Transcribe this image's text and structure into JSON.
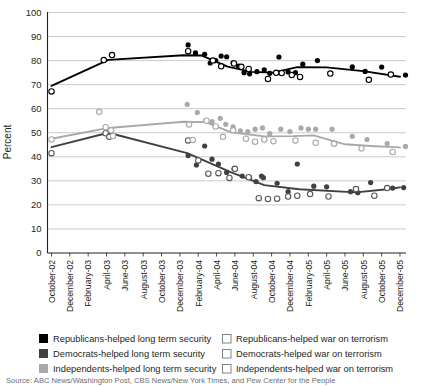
{
  "chart_data": {
    "type": "line",
    "title": "",
    "xlabel": "",
    "ylabel": "Percent",
    "ylim": [
      0,
      100
    ],
    "yticks": [
      0,
      10,
      20,
      30,
      40,
      50,
      60,
      70,
      80,
      90,
      100
    ],
    "grid": true,
    "legend_position": "bottom",
    "categories": [
      "October-02",
      "December-02",
      "February-03",
      "April-03",
      "June-03",
      "August-03",
      "October-03",
      "December-03",
      "February-04",
      "April-04",
      "June-04",
      "August-04",
      "October-04",
      "December-04",
      "February-05",
      "April-05",
      "June-05",
      "August-05",
      "October-05",
      "December-05"
    ],
    "series": [
      {
        "name": "Republicans-helped long term security",
        "marker": "filled-circle",
        "color": "#000000",
        "trend_color": "#000000",
        "trend": [
          {
            "x": 0,
            "y": 69.5
          },
          {
            "x": 3.1,
            "y": 80.3
          },
          {
            "x": 7.2,
            "y": 82.2
          },
          {
            "x": 8.2,
            "y": 82.1
          },
          {
            "x": 9.6,
            "y": 77.5
          },
          {
            "x": 10.9,
            "y": 75.3
          },
          {
            "x": 12.1,
            "y": 75.0
          },
          {
            "x": 13.4,
            "y": 77.3
          },
          {
            "x": 15.0,
            "y": 77.2
          },
          {
            "x": 17.0,
            "y": 75.6
          },
          {
            "x": 19.0,
            "y": 73.3
          }
        ],
        "points": [
          {
            "x": 7.45,
            "y": 86.5
          },
          {
            "x": 7.85,
            "y": 83.2
          },
          {
            "x": 8.35,
            "y": 82.6
          },
          {
            "x": 8.65,
            "y": 79.0
          },
          {
            "x": 8.95,
            "y": 80.0
          },
          {
            "x": 9.25,
            "y": 81.9
          },
          {
            "x": 9.55,
            "y": 81.6
          },
          {
            "x": 9.9,
            "y": 79.1
          },
          {
            "x": 10.2,
            "y": 77.7
          },
          {
            "x": 10.5,
            "y": 75.0
          },
          {
            "x": 10.8,
            "y": 74.5
          },
          {
            "x": 11.2,
            "y": 75.4
          },
          {
            "x": 11.6,
            "y": 76.2
          },
          {
            "x": 11.9,
            "y": 74.7
          },
          {
            "x": 12.4,
            "y": 81.5
          },
          {
            "x": 12.9,
            "y": 75.3
          },
          {
            "x": 13.3,
            "y": 75.0
          },
          {
            "x": 13.7,
            "y": 78.5
          },
          {
            "x": 14.5,
            "y": 80.0
          },
          {
            "x": 16.4,
            "y": 77.4
          },
          {
            "x": 17.1,
            "y": 75.5
          },
          {
            "x": 18.0,
            "y": 77.3
          },
          {
            "x": 19.3,
            "y": 74.0
          }
        ]
      },
      {
        "name": "Democrats-helped long term security",
        "marker": "filled-circle",
        "color": "#404040",
        "trend_color": "#404040",
        "trend": [
          {
            "x": 0,
            "y": 44.0
          },
          {
            "x": 3.1,
            "y": 50.0
          },
          {
            "x": 7.4,
            "y": 41.5
          },
          {
            "x": 9.8,
            "y": 33.5
          },
          {
            "x": 11.6,
            "y": 28.2
          },
          {
            "x": 13.5,
            "y": 26.5
          },
          {
            "x": 16.6,
            "y": 25.2
          },
          {
            "x": 18.3,
            "y": 26.5
          },
          {
            "x": 19.0,
            "y": 27.3
          }
        ],
        "points": [
          {
            "x": 7.45,
            "y": 40.5
          },
          {
            "x": 7.9,
            "y": 36.6
          },
          {
            "x": 8.35,
            "y": 44.5
          },
          {
            "x": 8.75,
            "y": 39.0
          },
          {
            "x": 9.1,
            "y": 37.0
          },
          {
            "x": 9.55,
            "y": 33.5
          },
          {
            "x": 9.95,
            "y": 35.0
          },
          {
            "x": 10.4,
            "y": 32.0
          },
          {
            "x": 10.8,
            "y": 31.5
          },
          {
            "x": 11.15,
            "y": 29.7
          },
          {
            "x": 11.45,
            "y": 32.0
          },
          {
            "x": 11.55,
            "y": 31.3
          },
          {
            "x": 12.3,
            "y": 29.0
          },
          {
            "x": 12.9,
            "y": 25.5
          },
          {
            "x": 13.4,
            "y": 37.0
          },
          {
            "x": 14.3,
            "y": 27.8
          },
          {
            "x": 15.0,
            "y": 27.5
          },
          {
            "x": 16.3,
            "y": 25.5
          },
          {
            "x": 16.7,
            "y": 25.1
          },
          {
            "x": 17.4,
            "y": 29.3
          },
          {
            "x": 18.6,
            "y": 27.0
          },
          {
            "x": 19.2,
            "y": 27.2
          }
        ]
      },
      {
        "name": "Independents-helped long term security",
        "marker": "filled-circle",
        "color": "#a7a9ac",
        "trend_color": "#a7a9ac",
        "trend": [
          {
            "x": 0,
            "y": 47.5
          },
          {
            "x": 3.1,
            "y": 52.0
          },
          {
            "x": 7.2,
            "y": 54.6
          },
          {
            "x": 8.4,
            "y": 54.4
          },
          {
            "x": 9.8,
            "y": 50.2
          },
          {
            "x": 11.6,
            "y": 48.5
          },
          {
            "x": 13.2,
            "y": 48.6
          },
          {
            "x": 14.3,
            "y": 48.9
          },
          {
            "x": 16.0,
            "y": 45.2
          },
          {
            "x": 17.4,
            "y": 44.5
          },
          {
            "x": 19.0,
            "y": 43.9
          }
        ],
        "points": [
          {
            "x": 7.4,
            "y": 61.8
          },
          {
            "x": 7.95,
            "y": 58.4
          },
          {
            "x": 8.4,
            "y": 55.2
          },
          {
            "x": 8.75,
            "y": 54.6
          },
          {
            "x": 9.2,
            "y": 56.0
          },
          {
            "x": 9.5,
            "y": 53.5
          },
          {
            "x": 9.9,
            "y": 52.5
          },
          {
            "x": 10.3,
            "y": 50.8
          },
          {
            "x": 10.7,
            "y": 50.5
          },
          {
            "x": 11.1,
            "y": 51.5
          },
          {
            "x": 11.5,
            "y": 52.0
          },
          {
            "x": 11.9,
            "y": 49.6
          },
          {
            "x": 12.5,
            "y": 51.5
          },
          {
            "x": 13.0,
            "y": 50.5
          },
          {
            "x": 13.6,
            "y": 52.0
          },
          {
            "x": 14.0,
            "y": 51.5
          },
          {
            "x": 14.4,
            "y": 51.5
          },
          {
            "x": 15.3,
            "y": 51.5
          },
          {
            "x": 16.4,
            "y": 48.5
          },
          {
            "x": 17.2,
            "y": 47.2
          },
          {
            "x": 18.3,
            "y": 45.5
          },
          {
            "x": 19.3,
            "y": 44.3
          }
        ]
      },
      {
        "name": "Republicans-helped war on terrorism",
        "marker": "open-circle",
        "color": "#000000",
        "points": [
          {
            "x": 0,
            "y": 67.2
          },
          {
            "x": 2.85,
            "y": 80.2
          },
          {
            "x": 3.3,
            "y": 82.3
          },
          {
            "x": 7.45,
            "y": 83.9
          },
          {
            "x": 8.8,
            "y": 80.0
          },
          {
            "x": 9.25,
            "y": 77.6
          },
          {
            "x": 9.95,
            "y": 78.8
          },
          {
            "x": 10.35,
            "y": 77.4
          },
          {
            "x": 10.75,
            "y": 76.5
          },
          {
            "x": 11.8,
            "y": 72.4
          },
          {
            "x": 12.25,
            "y": 74.9
          },
          {
            "x": 12.55,
            "y": 74.8
          },
          {
            "x": 13.1,
            "y": 74.0
          },
          {
            "x": 13.55,
            "y": 73.2
          },
          {
            "x": 15.2,
            "y": 74.6
          },
          {
            "x": 17.3,
            "y": 72.0
          },
          {
            "x": 18.5,
            "y": 74.2
          }
        ]
      },
      {
        "name": "Democrats-helped war on terrorism",
        "marker": "open-circle",
        "color": "#404040",
        "points": [
          {
            "x": 0,
            "y": 41.5
          },
          {
            "x": 2.95,
            "y": 49.8
          },
          {
            "x": 3.15,
            "y": 48.3
          },
          {
            "x": 7.45,
            "y": 46.8
          },
          {
            "x": 8.0,
            "y": 38.5
          },
          {
            "x": 8.55,
            "y": 33.0
          },
          {
            "x": 9.1,
            "y": 33.2
          },
          {
            "x": 9.7,
            "y": 31.2
          },
          {
            "x": 10.0,
            "y": 35.0
          },
          {
            "x": 10.75,
            "y": 31.5
          },
          {
            "x": 11.3,
            "y": 22.8
          },
          {
            "x": 11.8,
            "y": 22.5
          },
          {
            "x": 12.3,
            "y": 22.6
          },
          {
            "x": 12.9,
            "y": 23.5
          },
          {
            "x": 13.4,
            "y": 23.8
          },
          {
            "x": 14.1,
            "y": 24.5
          },
          {
            "x": 15.1,
            "y": 23.5
          },
          {
            "x": 16.6,
            "y": 26.6
          },
          {
            "x": 17.6,
            "y": 23.8
          },
          {
            "x": 18.3,
            "y": 27.0
          }
        ]
      },
      {
        "name": "Independents-helped war on terrorism",
        "marker": "open-circle",
        "color": "#a7a9ac",
        "points": [
          {
            "x": 0,
            "y": 47.2
          },
          {
            "x": 2.6,
            "y": 58.7
          },
          {
            "x": 2.95,
            "y": 52.3
          },
          {
            "x": 3.25,
            "y": 51.0
          },
          {
            "x": 3.35,
            "y": 48.6
          },
          {
            "x": 7.5,
            "y": 53.4
          },
          {
            "x": 7.7,
            "y": 47.0
          },
          {
            "x": 8.45,
            "y": 55.0
          },
          {
            "x": 8.95,
            "y": 52.6
          },
          {
            "x": 9.35,
            "y": 48.3
          },
          {
            "x": 9.9,
            "y": 51.0
          },
          {
            "x": 10.6,
            "y": 47.5
          },
          {
            "x": 11.1,
            "y": 46.3
          },
          {
            "x": 11.6,
            "y": 47.2
          },
          {
            "x": 12.1,
            "y": 46.5
          },
          {
            "x": 13.3,
            "y": 46.8
          },
          {
            "x": 14.4,
            "y": 45.8
          },
          {
            "x": 15.4,
            "y": 45.4
          },
          {
            "x": 16.9,
            "y": 43.5
          },
          {
            "x": 18.6,
            "y": 42.0
          }
        ]
      }
    ],
    "legend": [
      {
        "label": "Republicans-helped long term security",
        "marker": "filled-square",
        "color": "#000000"
      },
      {
        "label": "Democrats-helped long term security",
        "marker": "filled-square",
        "color": "#404040"
      },
      {
        "label": "Independents-helped long term security",
        "marker": "filled-square",
        "color": "#a7a9ac"
      },
      {
        "label": "Republicans-helped war on terrorism",
        "marker": "open-square",
        "color": "#808285"
      },
      {
        "label": "Democrats-helped war on terrorism",
        "marker": "open-square",
        "color": "#808285"
      },
      {
        "label": "Independents-helped war on terrorism",
        "marker": "open-square",
        "color": "#808285"
      }
    ],
    "source": "Source:   ABC News/Washington Post, CBS News/New York Times, and Pew Center for the People"
  }
}
